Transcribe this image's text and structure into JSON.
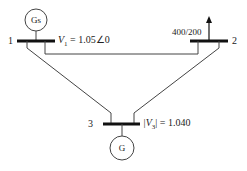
{
  "diagram": {
    "type": "three-bus power system one-line diagram",
    "buses": [
      {
        "id": "1",
        "label": "1",
        "annotation_var": "V",
        "annotation_sub": "1",
        "annotation_value": " = 1.05∠0",
        "generator": "Gs"
      },
      {
        "id": "2",
        "label": "2",
        "load": "400/200"
      },
      {
        "id": "3",
        "label": "3",
        "annotation_var": "|V",
        "annotation_sub": "3",
        "annotation_value": "| = 1.040",
        "generator": "G"
      }
    ],
    "lines": [
      {
        "from": "1",
        "to": "2"
      },
      {
        "from": "1",
        "to": "3"
      },
      {
        "from": "2",
        "to": "3"
      }
    ],
    "colors": {
      "line": "#444444",
      "bus": "#111111",
      "text": "#222222"
    }
  }
}
